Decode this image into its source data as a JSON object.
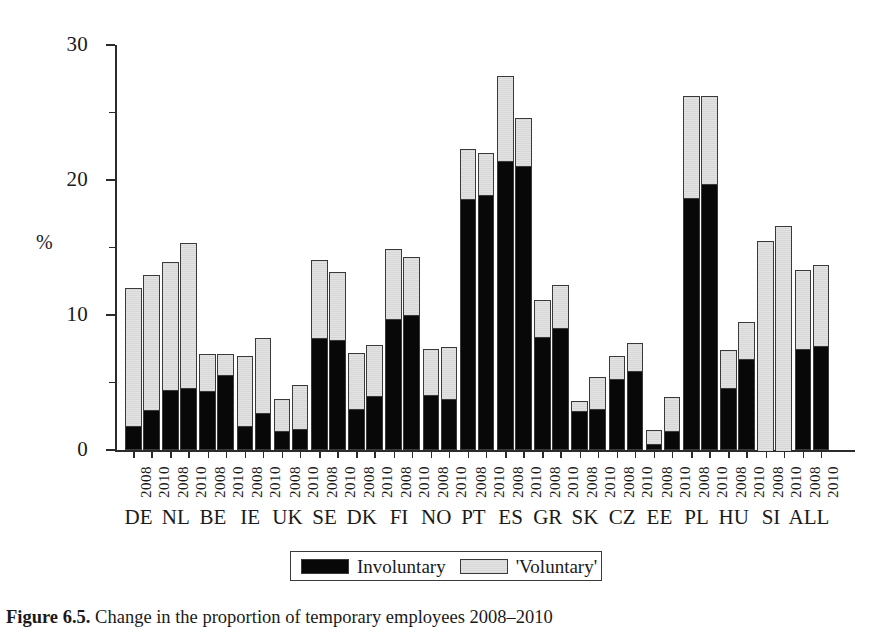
{
  "figure": {
    "caption_label": "Figure 6.5.",
    "caption_text": "Change in the proportion of temporary employees 2008–2010"
  },
  "legend": {
    "position": "bottom-center",
    "entries": [
      {
        "key": "involuntary",
        "label": "Involuntary",
        "color": "#080808"
      },
      {
        "key": "voluntary",
        "label": "'Voluntary'",
        "color": "#e3e3e3"
      }
    ]
  },
  "axes": {
    "y_title": "%",
    "y_ticks": [
      "0",
      "10",
      "20",
      "30"
    ],
    "y_minor_ticks": [
      "5",
      "15",
      "25"
    ],
    "y_min": 0,
    "y_max": 30,
    "grid": false
  },
  "chart_data": {
    "type": "bar",
    "title": "Change in the proportion of temporary employees 2008–2010",
    "xlabel": "",
    "ylabel": "%",
    "ylim": [
      0,
      30
    ],
    "stacked": true,
    "grid": false,
    "legend_position": "bottom-center",
    "categories": [
      "DE",
      "NL",
      "BE",
      "IE",
      "UK",
      "SE",
      "DK",
      "FI",
      "NO",
      "PT",
      "ES",
      "GR",
      "SK",
      "CZ",
      "EE",
      "PL",
      "HU",
      "SI",
      "ALL"
    ],
    "sub_categories": [
      "2008",
      "2010"
    ],
    "series": [
      {
        "name": "Involuntary",
        "color": "#080808",
        "values_2008": [
          1.7,
          4.4,
          4.3,
          1.7,
          1.3,
          8.2,
          3.0,
          9.6,
          4.0,
          18.5,
          21.3,
          8.3,
          2.8,
          5.2,
          0.4,
          18.6,
          4.5,
          0.0,
          7.4
        ],
        "values_2010": [
          2.9,
          4.5,
          5.5,
          2.7,
          1.5,
          8.1,
          3.9,
          9.9,
          3.7,
          18.8,
          21.0,
          9.0,
          3.0,
          5.8,
          1.3,
          19.6,
          6.7,
          0.0,
          7.6
        ]
      },
      {
        "name": "'Voluntary'",
        "color": "#e3e3e3",
        "values_2008": [
          10.3,
          9.5,
          2.8,
          5.3,
          2.5,
          5.9,
          4.2,
          5.3,
          3.5,
          3.8,
          6.4,
          2.8,
          0.8,
          1.8,
          1.1,
          7.6,
          2.9,
          15.5,
          5.9
        ],
        "values_2010": [
          10.1,
          10.8,
          1.6,
          5.6,
          3.3,
          5.1,
          3.9,
          4.4,
          3.9,
          3.2,
          3.6,
          3.2,
          2.4,
          2.1,
          2.6,
          6.6,
          2.8,
          16.6,
          6.1
        ]
      }
    ],
    "totals_2008": [
      12.0,
      13.9,
      7.1,
      7.0,
      3.8,
      14.1,
      7.2,
      14.9,
      7.5,
      22.3,
      27.7,
      11.1,
      3.6,
      7.0,
      1.5,
      26.2,
      7.4,
      15.5,
      13.3
    ],
    "totals_2010": [
      13.0,
      15.3,
      7.1,
      8.3,
      4.8,
      13.2,
      7.8,
      14.3,
      7.6,
      22.0,
      24.6,
      12.2,
      5.4,
      7.9,
      3.9,
      26.2,
      9.5,
      16.6,
      13.7
    ]
  }
}
